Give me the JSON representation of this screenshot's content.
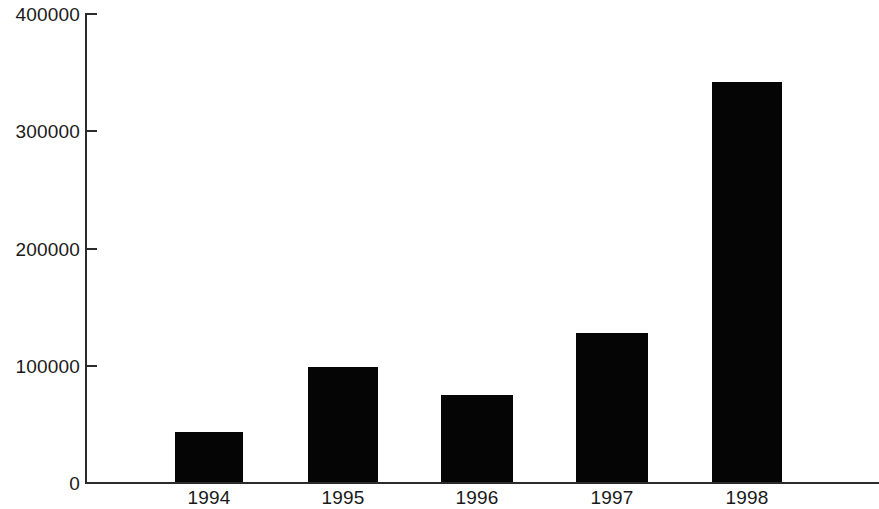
{
  "chart_data": {
    "type": "bar",
    "title": "",
    "subtitle": "",
    "xlabel": "",
    "ylabel": "",
    "categories": [
      "1994",
      "1995",
      "1996",
      "1997",
      "1998"
    ],
    "values": [
      43000,
      98000,
      74000,
      127000,
      342000
    ],
    "series": [
      {
        "name": "",
        "values": [
          43000,
          98000,
          74000,
          127000,
          342000
        ]
      }
    ],
    "ylim": [
      0,
      400000
    ],
    "xlim": [
      0,
      5
    ],
    "y_ticks": [
      0,
      100000,
      200000,
      300000,
      400000
    ],
    "y_tick_labels": [
      "0",
      "100000",
      "200000",
      "300000",
      "400000"
    ],
    "x_tick_labels": [
      "1994",
      "1995",
      "1996",
      "1997",
      "1998"
    ],
    "grid": false,
    "legend": false,
    "legend_position": "none",
    "bar_color": "#050505",
    "axis_color": "#2b2b2b",
    "background_color": "#ffffff",
    "text_color": "#1a1a1a",
    "annotations": []
  },
  "axis": {
    "y_labels": [
      {
        "text": "400000",
        "value": 400000
      },
      {
        "text": "300000",
        "value": 300000
      },
      {
        "text": "200000",
        "value": 200000
      },
      {
        "text": "100000",
        "value": 100000
      },
      {
        "text": "0",
        "value": 0
      }
    ],
    "x_labels": [
      {
        "text": "1994"
      },
      {
        "text": "1995"
      },
      {
        "text": "1996"
      },
      {
        "text": "1997"
      },
      {
        "text": "1998"
      }
    ]
  },
  "bars": [
    {
      "label": "1994",
      "value": 43000,
      "left": 175,
      "width": 68
    },
    {
      "label": "1995",
      "value": 98000,
      "left": 308,
      "width": 70
    },
    {
      "label": "1996",
      "value": 74000,
      "left": 441,
      "width": 72
    },
    {
      "label": "1997",
      "value": 127000,
      "left": 576,
      "width": 72
    },
    {
      "label": "1998",
      "value": 342000,
      "left": 712,
      "width": 70
    }
  ]
}
